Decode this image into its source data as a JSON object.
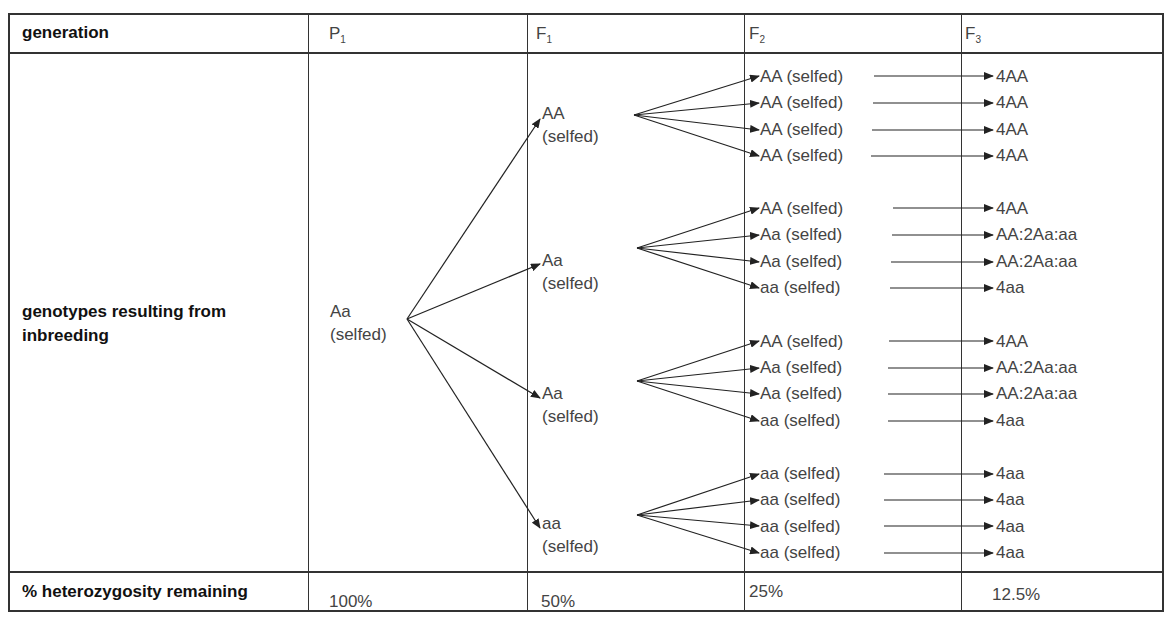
{
  "header": {
    "row_label": "generation",
    "cols": [
      {
        "base": "P",
        "sub": "1"
      },
      {
        "base": "F",
        "sub": "1"
      },
      {
        "base": "F",
        "sub": "2"
      },
      {
        "base": "F",
        "sub": "3"
      }
    ]
  },
  "body": {
    "row_label_line1": "genotypes resulting from",
    "row_label_line2": "inbreeding",
    "p1": {
      "genotype": "Aa",
      "note": "(selfed)"
    },
    "f1": [
      {
        "genotype": "AA",
        "note": "(selfed)"
      },
      {
        "genotype": "Aa",
        "note": "(selfed)"
      },
      {
        "genotype": "Aa",
        "note": "(selfed)"
      },
      {
        "genotype": "aa",
        "note": "(selfed)"
      }
    ],
    "f2": [
      "AA (selfed)",
      "AA (selfed)",
      "AA (selfed)",
      "AA (selfed)",
      "AA (selfed)",
      "Aa (selfed)",
      "Aa (selfed)",
      "aa (selfed)",
      "AA (selfed)",
      "Aa (selfed)",
      "Aa (selfed)",
      "aa (selfed)",
      "aa (selfed)",
      "aa (selfed)",
      "aa (selfed)",
      "aa (selfed)"
    ],
    "f3": [
      "4AA",
      "4AA",
      "4AA",
      "4AA",
      "4AA",
      "AA:2Aa:aa",
      "AA:2Aa:aa",
      "4aa",
      "4AA",
      "AA:2Aa:aa",
      "AA:2Aa:aa",
      "4aa",
      "4aa",
      "4aa",
      "4aa",
      "4aa"
    ]
  },
  "footer": {
    "row_label": "% heterozygosity remaining",
    "values": [
      "100%",
      "50%",
      "25%",
      "12.5%"
    ]
  }
}
